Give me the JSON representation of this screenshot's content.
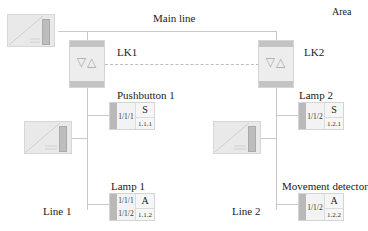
{
  "diagram": {
    "area_label": "Area",
    "main_line_label": "Main line",
    "line1_label": "Line 1",
    "line2_label": "Line 2",
    "couplers": [
      {
        "label": "LK1",
        "icon": "up-down-triangles-icon"
      },
      {
        "label": "LK2",
        "icon": "up-down-triangles-icon"
      }
    ],
    "power_supplies": [
      {
        "name": "main-line-power-supply"
      },
      {
        "name": "line1-power-supply"
      },
      {
        "name": "line2-power-supply"
      }
    ],
    "devices": [
      {
        "label": "Pushbutton 1",
        "type": "S",
        "group_addresses": [
          "1/1/1"
        ],
        "physical_address": "1.1.1"
      },
      {
        "label": "Lamp 1",
        "type": "A",
        "group_addresses": [
          "1/1/1",
          "1/1/2"
        ],
        "physical_address": "1.1.2"
      },
      {
        "label": "Lamp 2",
        "type": "S",
        "group_addresses": [
          "1/1/2"
        ],
        "physical_address": "1.2.1"
      },
      {
        "label": "Movement detector",
        "type": "A",
        "group_addresses": [
          "1/1/2"
        ],
        "physical_address": "1.2.2"
      }
    ],
    "colors": {
      "line": "#c8c8c8",
      "device_strip": "#b9b9b9",
      "box_fill": "#ededed"
    }
  }
}
